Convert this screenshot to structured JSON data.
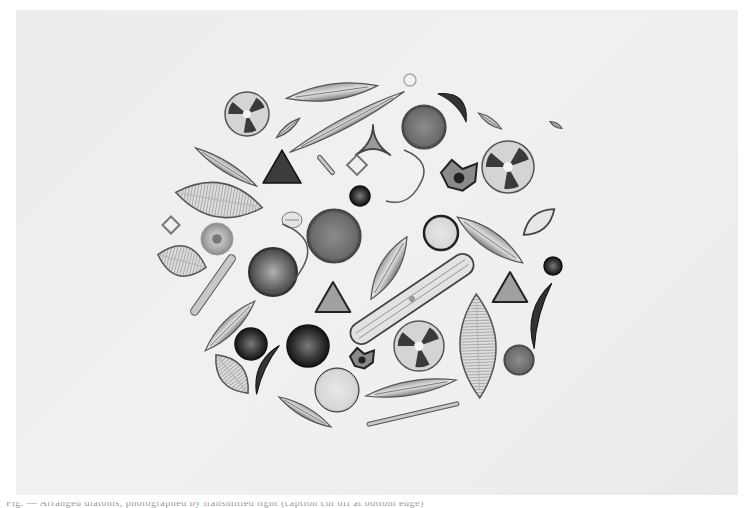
{
  "image": {
    "subject": "Arranged diatom specimens in a circular composition, photomicrograph plate",
    "style": "black-and-white photograph",
    "background_color": "#eeeeee",
    "page_color": "#ffffff"
  },
  "caption": {
    "text": "Fig. — Arranged diatoms, photographed by transmitted light (caption cut off at bottom edge)"
  },
  "specimens": [
    {
      "shape": "radial-disc",
      "cx": 247,
      "cy": 114,
      "r": 22
    },
    {
      "shape": "lens",
      "cx": 332,
      "cy": 92,
      "rx": 46,
      "ry": 8,
      "rot": -8
    },
    {
      "shape": "ring",
      "cx": 410,
      "cy": 80,
      "r": 6
    },
    {
      "shape": "lens",
      "cx": 347,
      "cy": 122,
      "rx": 65,
      "ry": 5,
      "rot": -28
    },
    {
      "shape": "crescent-dark",
      "cx": 452,
      "cy": 108,
      "rx": 20,
      "ry": 8,
      "rot": 45
    },
    {
      "shape": "lens",
      "cx": 490,
      "cy": 121,
      "rx": 14,
      "ry": 3,
      "rot": 35
    },
    {
      "shape": "lens",
      "cx": 556,
      "cy": 125,
      "rx": 7,
      "ry": 2,
      "rot": 30
    },
    {
      "shape": "disc-gray",
      "cx": 424,
      "cy": 127,
      "r": 22
    },
    {
      "shape": "lens",
      "cx": 288,
      "cy": 128,
      "rx": 15,
      "ry": 3,
      "rot": -40
    },
    {
      "shape": "triangle-star",
      "cx": 373,
      "cy": 145,
      "r": 20
    },
    {
      "shape": "radial-disc",
      "cx": 508,
      "cy": 167,
      "r": 26
    },
    {
      "shape": "lens",
      "cx": 226,
      "cy": 167,
      "rx": 36,
      "ry": 5,
      "rot": 32
    },
    {
      "shape": "triangle-dark",
      "cx": 282,
      "cy": 172,
      "r": 22
    },
    {
      "shape": "rod",
      "cx": 326,
      "cy": 165,
      "rx": 12,
      "ry": 2,
      "rot": 50
    },
    {
      "shape": "square-outline",
      "cx": 357,
      "cy": 165,
      "r": 7
    },
    {
      "shape": "hook",
      "cx": 410,
      "cy": 180,
      "r": 30
    },
    {
      "shape": "c-cell",
      "cx": 459,
      "cy": 178,
      "r": 18
    },
    {
      "shape": "disc-dark",
      "cx": 360,
      "cy": 196,
      "r": 10
    },
    {
      "shape": "lens-ribbed",
      "cx": 219,
      "cy": 200,
      "rx": 44,
      "ry": 17,
      "rot": 10
    },
    {
      "shape": "lens-small",
      "cx": 292,
      "cy": 220,
      "rx": 10,
      "ry": 8,
      "rot": 0
    },
    {
      "shape": "disc-gray",
      "cx": 334,
      "cy": 236,
      "r": 27
    },
    {
      "shape": "disc-light",
      "cx": 441,
      "cy": 233,
      "r": 17
    },
    {
      "shape": "lens",
      "cx": 490,
      "cy": 240,
      "rx": 40,
      "ry": 9,
      "rot": 35
    },
    {
      "shape": "lens-outline",
      "cx": 539,
      "cy": 222,
      "rx": 20,
      "ry": 8,
      "rot": -40
    },
    {
      "shape": "square-outline",
      "cx": 171,
      "cy": 225,
      "r": 6
    },
    {
      "shape": "disc-gray-light",
      "cx": 217,
      "cy": 239,
      "r": 16
    },
    {
      "shape": "lens-ribbed",
      "cx": 182,
      "cy": 261,
      "rx": 25,
      "ry": 15,
      "rot": 15
    },
    {
      "shape": "rod",
      "cx": 213,
      "cy": 285,
      "rx": 36,
      "ry": 4,
      "rot": -55
    },
    {
      "shape": "disc-textured",
      "cx": 273,
      "cy": 272,
      "r": 24
    },
    {
      "shape": "hook",
      "cx": 290,
      "cy": 262,
      "r": 38
    },
    {
      "shape": "lens",
      "cx": 389,
      "cy": 268,
      "rx": 36,
      "ry": 9,
      "rot": -60
    },
    {
      "shape": "disc-dark",
      "cx": 553,
      "cy": 266,
      "r": 9
    },
    {
      "shape": "triangle-light",
      "cx": 333,
      "cy": 302,
      "r": 20
    },
    {
      "shape": "rod-long",
      "cx": 412,
      "cy": 299,
      "rx": 72,
      "ry": 11,
      "rot": -34
    },
    {
      "shape": "triangle-light",
      "cx": 510,
      "cy": 292,
      "r": 20
    },
    {
      "shape": "crescent-dark",
      "cx": 543,
      "cy": 316,
      "rx": 34,
      "ry": 7,
      "rot": -75
    },
    {
      "shape": "lens",
      "cx": 230,
      "cy": 326,
      "rx": 35,
      "ry": 7,
      "rot": -45
    },
    {
      "shape": "disc-dark",
      "cx": 251,
      "cy": 344,
      "r": 16
    },
    {
      "shape": "disc-dark",
      "cx": 308,
      "cy": 346,
      "r": 21
    },
    {
      "shape": "radial-disc",
      "cx": 419,
      "cy": 346,
      "r": 25
    },
    {
      "shape": "lens-ribbed",
      "cx": 478,
      "cy": 346,
      "rx": 52,
      "ry": 18,
      "rot": 88
    },
    {
      "shape": "c-cell",
      "cx": 362,
      "cy": 360,
      "r": 12
    },
    {
      "shape": "disc-gray",
      "cx": 519,
      "cy": 360,
      "r": 15
    },
    {
      "shape": "lens-ribbed",
      "cx": 232,
      "cy": 374,
      "rx": 25,
      "ry": 12,
      "rot": 50
    },
    {
      "shape": "crescent-dark",
      "cx": 268,
      "cy": 370,
      "rx": 27,
      "ry": 6,
      "rot": -65
    },
    {
      "shape": "disc-light",
      "cx": 337,
      "cy": 390,
      "r": 22
    },
    {
      "shape": "lens",
      "cx": 411,
      "cy": 388,
      "rx": 46,
      "ry": 7,
      "rot": -10
    },
    {
      "shape": "lens",
      "cx": 305,
      "cy": 412,
      "rx": 30,
      "ry": 5,
      "rot": 30
    },
    {
      "shape": "rod",
      "cx": 413,
      "cy": 414,
      "rx": 47,
      "ry": 2,
      "rot": -13
    }
  ]
}
